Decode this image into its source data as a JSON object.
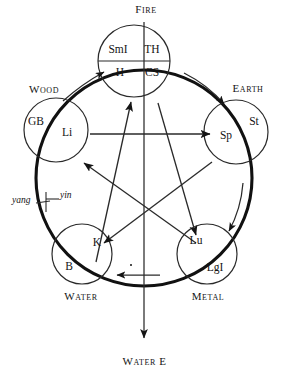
{
  "figure": {
    "colors": {
      "ink": "#141414",
      "background": "#ffffff",
      "thick_cycle_stroke": "#111111",
      "thin_stroke": "#2a2a2a"
    },
    "caption": "Water  E"
  },
  "elements": [
    {
      "key": "fire",
      "name": "Fire",
      "label_x": 146,
      "label_y": 9,
      "circle": {
        "cx": 134,
        "cy": 61,
        "r": 36
      },
      "organs": [
        {
          "abbr": "SmI",
          "x": 118,
          "y": 50
        },
        {
          "abbr": "TH",
          "x": 152,
          "y": 50
        },
        {
          "abbr": "H",
          "x": 120,
          "y": 73
        },
        {
          "abbr": "CS",
          "x": 152,
          "y": 73
        }
      ]
    },
    {
      "key": "wood",
      "name": "Wood",
      "label_x": 44,
      "label_y": 89,
      "circle": {
        "cx": 56,
        "cy": 130,
        "r": 32
      },
      "organs": [
        {
          "abbr": "GB",
          "x": 36,
          "y": 122
        },
        {
          "abbr": "Li",
          "x": 67,
          "y": 133
        }
      ]
    },
    {
      "key": "earth",
      "name": "Earth",
      "label_x": 248,
      "label_y": 88,
      "circle": {
        "cx": 236,
        "cy": 132,
        "r": 32
      },
      "organs": [
        {
          "abbr": "Sp",
          "x": 226,
          "y": 136
        },
        {
          "abbr": "St",
          "x": 254,
          "y": 122
        }
      ]
    },
    {
      "key": "water",
      "name": "Water",
      "label_x": 81,
      "label_y": 296,
      "circle": {
        "cx": 82,
        "cy": 254,
        "r": 30
      },
      "organs": [
        {
          "abbr": "K",
          "x": 97,
          "y": 243
        },
        {
          "abbr": "B",
          "x": 69,
          "y": 267
        }
      ]
    },
    {
      "key": "metal",
      "name": "Metal",
      "label_x": 208,
      "label_y": 296,
      "circle": {
        "cx": 207,
        "cy": 254,
        "r": 30
      },
      "organs": [
        {
          "abbr": "Lu",
          "x": 196,
          "y": 241
        },
        {
          "abbr": "LgI",
          "x": 215,
          "y": 268
        }
      ]
    }
  ],
  "polarity": [
    {
      "label": "yang",
      "x": 12,
      "y": 201
    },
    {
      "label": "yin",
      "x": 60,
      "y": 196
    }
  ]
}
